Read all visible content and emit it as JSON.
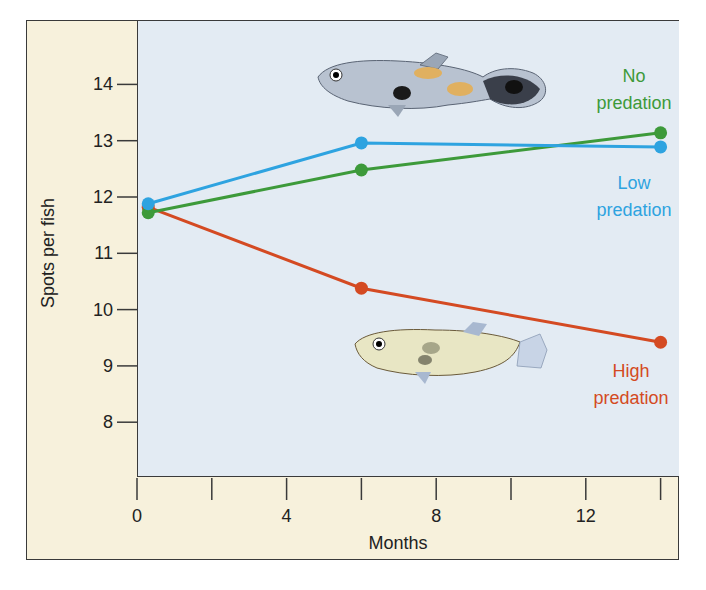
{
  "chart_data": {
    "type": "line",
    "title": "",
    "xlabel": "Months",
    "ylabel": "Spots per fish",
    "xlim": [
      0,
      14.5
    ],
    "ylim": [
      7,
      14.8
    ],
    "x_ticks": [
      0,
      2,
      4,
      6,
      8,
      10,
      12,
      14
    ],
    "x_tick_labels": [
      "0",
      "",
      "4",
      "",
      "8",
      "",
      "12",
      ""
    ],
    "y_ticks": [
      8,
      9,
      10,
      11,
      12,
      13,
      14
    ],
    "y_tick_labels": [
      "8",
      "9",
      "10",
      "11",
      "12",
      "13",
      "14"
    ],
    "grid": false,
    "legend_position": "inline-right",
    "series": [
      {
        "name": "No predation",
        "label_lines": [
          "No",
          "predation"
        ],
        "color": "#3d9a3a",
        "x": [
          0.3,
          6,
          14
        ],
        "values": [
          11.72,
          12.48,
          13.14
        ]
      },
      {
        "name": "Low predation",
        "label_lines": [
          "Low",
          "predation"
        ],
        "color": "#2ea3e0",
        "x": [
          0.3,
          6,
          14
        ],
        "values": [
          11.88,
          12.96,
          12.89
        ]
      },
      {
        "name": "High predation",
        "label_lines": [
          "High",
          "predation"
        ],
        "color": "#d44a22",
        "x": [
          0.3,
          6,
          14
        ],
        "values": [
          11.82,
          10.38,
          9.42
        ]
      }
    ],
    "annotations": [
      "Colorful spotted guppy illustration (top)",
      "Drab guppy illustration (bottom)"
    ]
  },
  "colors": {
    "frame_background": "#f7f1dc",
    "plot_background": "#e3ebf3",
    "axis": "#3a3a3a"
  }
}
